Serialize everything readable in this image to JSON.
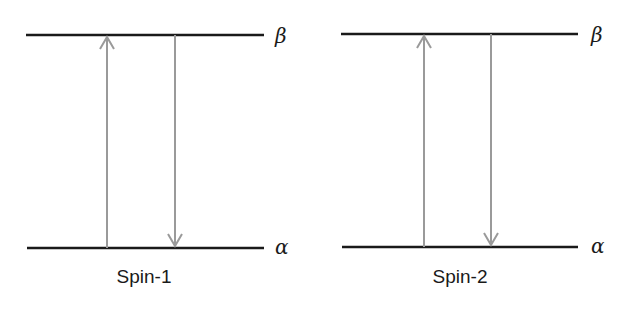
{
  "panels": [
    {
      "caption": "Spin-1",
      "upper_level_label": "β",
      "lower_level_label": "α",
      "transitions": [
        {
          "direction": "up",
          "from": "α",
          "to": "β"
        },
        {
          "direction": "down",
          "from": "β",
          "to": "α"
        }
      ]
    },
    {
      "caption": "Spin-2",
      "upper_level_label": "β",
      "lower_level_label": "α",
      "transitions": [
        {
          "direction": "up",
          "from": "α",
          "to": "β"
        },
        {
          "direction": "down",
          "from": "β",
          "to": "α"
        }
      ]
    }
  ],
  "colors": {
    "level_line": "#1a1a1a",
    "arrow": "#9a9a9a",
    "text": "#1a1a1a"
  }
}
